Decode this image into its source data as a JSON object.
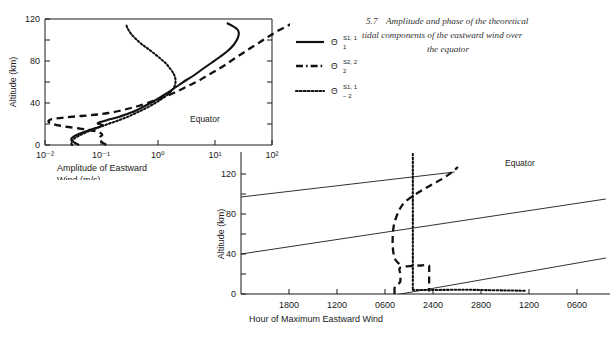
{
  "figure": {
    "caption_number": "5.7",
    "caption_text": "Amplitude and phase of the theoretical tidal components of the eastward wind over the equator"
  },
  "legend": {
    "entries": [
      {
        "style": "solid",
        "symbol": "Θ",
        "superscript": "S1, 1",
        "subscript": "1"
      },
      {
        "style": "dashed",
        "symbol": "Θ",
        "superscript": "S2, 2",
        "subscript": "2"
      },
      {
        "style": "dotted",
        "symbol": "Θ",
        "superscript": "S1, 1",
        "subscript": "− 2"
      }
    ]
  },
  "chart_data": [
    {
      "type": "line",
      "id": "amplitude",
      "title": "",
      "xlabel": "Amplitude of Eastward Wind (m/s)",
      "xlabel_line1": "Amplitude of Eastward",
      "xlabel_line2": "Wind (m/s)",
      "ylabel": "Altitude (km)",
      "annotation": "Equator",
      "xscale": "log",
      "xlim": [
        0.01,
        1000
      ],
      "ylim": [
        0,
        132
      ],
      "xticks": [
        0.01,
        0.1,
        1,
        10,
        100
      ],
      "xticklabels": [
        "10⁻²",
        "10⁻¹",
        "10⁰",
        "10¹",
        "10²"
      ],
      "yticks": [
        0,
        20,
        40,
        60,
        80,
        100,
        120
      ],
      "yticklabels": [
        "0",
        "",
        "40",
        "",
        "80",
        "",
        "120"
      ],
      "grid": false,
      "series": [
        {
          "name": "Θ S1,1 sub 1",
          "style": "solid",
          "points": [
            [
              0.04,
              0
            ],
            [
              0.034,
              2
            ],
            [
              0.03,
              4
            ],
            [
              0.029,
              6
            ],
            [
              0.031,
              8
            ],
            [
              0.036,
              10
            ],
            [
              0.044,
              12
            ],
            [
              0.055,
              14
            ],
            [
              0.07,
              16
            ],
            [
              0.09,
              18
            ],
            [
              0.105,
              19.5
            ],
            [
              0.097,
              20.5
            ],
            [
              0.085,
              21.5
            ],
            [
              0.09,
              22.5
            ],
            [
              0.11,
              24
            ],
            [
              0.145,
              26
            ],
            [
              0.2,
              28
            ],
            [
              0.28,
              31
            ],
            [
              0.42,
              35
            ],
            [
              0.62,
              40
            ],
            [
              0.9,
              45
            ],
            [
              1.25,
              50
            ],
            [
              1.7,
              55
            ],
            [
              2.3,
              60
            ],
            [
              3.1,
              65
            ],
            [
              4.3,
              70
            ],
            [
              6.0,
              76
            ],
            [
              8.5,
              82
            ],
            [
              12.0,
              88
            ],
            [
              16.5,
              94
            ],
            [
              21.0,
              100
            ],
            [
              24.5,
              106
            ],
            [
              26.0,
              111
            ],
            [
              25.0,
              115
            ],
            [
              21.5,
              118
            ],
            [
              18.0,
              120.5
            ],
            [
              16.0,
              122
            ]
          ]
        },
        {
          "name": "Θ S2,2 sub 2",
          "style": "dashed",
          "points": [
            [
              0.12,
              0
            ],
            [
              0.105,
              2
            ],
            [
              0.095,
              4
            ],
            [
              0.09,
              6
            ],
            [
              0.092,
              8
            ],
            [
              0.102,
              10
            ],
            [
              0.095,
              12
            ],
            [
              0.082,
              13.5
            ],
            [
              0.06,
              15
            ],
            [
              0.04,
              16.5
            ],
            [
              0.026,
              18
            ],
            [
              0.018,
              19.5
            ],
            [
              0.014,
              21
            ],
            [
              0.012,
              22.5
            ],
            [
              0.0115,
              24
            ],
            [
              0.0125,
              25.5
            ],
            [
              0.0155,
              26.5
            ],
            [
              0.022,
              27.5
            ],
            [
              0.034,
              28.5
            ],
            [
              0.055,
              29.5
            ],
            [
              0.085,
              30.5
            ],
            [
              0.13,
              32
            ],
            [
              0.2,
              34
            ],
            [
              0.3,
              36.5
            ],
            [
              0.44,
              39
            ],
            [
              0.64,
              42
            ],
            [
              0.9,
              45
            ],
            [
              1.3,
              48.5
            ],
            [
              1.85,
              52
            ],
            [
              2.6,
              56
            ],
            [
              3.6,
              60
            ],
            [
              5.0,
              64
            ],
            [
              7.0,
              69
            ],
            [
              10.0,
              74
            ],
            [
              14.0,
              79
            ],
            [
              20.0,
              85
            ],
            [
              29.0,
              91
            ],
            [
              42.0,
              97
            ],
            [
              62.0,
              103
            ],
            [
              90.0,
              109
            ],
            [
              135.0,
              115
            ],
            [
              200.0,
              120
            ],
            [
              280.0,
              124
            ]
          ]
        },
        {
          "name": "Θ S1,1 sub -2",
          "style": "dotted",
          "points": [
            [
              0.03,
              0
            ],
            [
              0.029,
              2
            ],
            [
              0.03,
              4
            ],
            [
              0.032,
              6
            ],
            [
              0.036,
              8
            ],
            [
              0.042,
              10
            ],
            [
              0.05,
              12
            ],
            [
              0.06,
              14
            ],
            [
              0.074,
              16
            ],
            [
              0.092,
              18
            ],
            [
              0.115,
              20
            ],
            [
              0.145,
              22
            ],
            [
              0.185,
              24
            ],
            [
              0.24,
              26.5
            ],
            [
              0.31,
              29
            ],
            [
              0.4,
              32
            ],
            [
              0.52,
              35
            ],
            [
              0.68,
              38.5
            ],
            [
              0.88,
              42
            ],
            [
              1.1,
              45.5
            ],
            [
              1.35,
              49
            ],
            [
              1.6,
              52.5
            ],
            [
              1.8,
              56
            ],
            [
              1.95,
              60
            ],
            [
              2.0,
              64
            ],
            [
              1.95,
              68
            ],
            [
              1.82,
              72
            ],
            [
              1.62,
              76
            ],
            [
              1.38,
              81
            ],
            [
              1.1,
              86
            ],
            [
              0.86,
              91
            ],
            [
              0.66,
              96
            ],
            [
              0.5,
              101
            ],
            [
              0.4,
              106
            ],
            [
              0.33,
              111
            ],
            [
              0.29,
              116
            ],
            [
              0.27,
              120
            ]
          ]
        }
      ]
    },
    {
      "type": "line",
      "id": "phase",
      "title": "",
      "xlabel": "Hour of Maximum Eastward Wind",
      "ylabel": "Altitude (km)",
      "annotation": "Equator",
      "xscale": "linear",
      "xlim": [
        0,
        7.6
      ],
      "ylim": [
        0,
        140
      ],
      "xticks": [
        1,
        2,
        3,
        4,
        5,
        6,
        7
      ],
      "xticklabels": [
        "1800",
        "1200",
        "0600",
        "2400",
        "2800",
        "1200",
        "0600"
      ],
      "yticks": [
        0,
        20,
        40,
        60,
        80,
        100,
        120
      ],
      "yticklabels": [
        "0",
        "",
        "40",
        "",
        "80",
        "",
        "120"
      ],
      "grid": false,
      "reference_lines": [
        {
          "name": "phase-line-lower",
          "x0": 0,
          "y0": -28,
          "x1": 7.6,
          "y1": 36
        },
        {
          "name": "phase-line-middle",
          "x0": 0,
          "y0": 40,
          "x1": 7.6,
          "y1": 95
        },
        {
          "name": "phase-line-upper",
          "x0": 0,
          "y0": 97,
          "x1": 4.45,
          "y1": 122
        }
      ],
      "series": [
        {
          "name": "Θ S2,2 sub 2",
          "style": "dashed",
          "points": [
            [
              3.2,
              0
            ],
            [
              3.2,
              6
            ],
            [
              3.25,
              9
            ],
            [
              3.3,
              11
            ],
            [
              3.32,
              13
            ],
            [
              3.32,
              18
            ],
            [
              3.31,
              22
            ],
            [
              3.3,
              25
            ],
            [
              3.35,
              27
            ],
            [
              3.55,
              28
            ],
            [
              3.75,
              28.5
            ],
            [
              3.9,
              29
            ],
            [
              3.92,
              27
            ],
            [
              3.92,
              22
            ],
            [
              3.92,
              16
            ],
            [
              3.92,
              10
            ],
            [
              3.92,
              4.5
            ],
            [
              3.92,
              2.5
            ]
          ],
          "points_upper": [
            [
              3.3,
              30
            ],
            [
              3.22,
              34
            ],
            [
              3.18,
              40
            ],
            [
              3.16,
              48
            ],
            [
              3.16,
              56
            ],
            [
              3.17,
              64
            ],
            [
              3.2,
              72
            ],
            [
              3.26,
              80
            ],
            [
              3.32,
              86
            ],
            [
              3.42,
              92
            ],
            [
              3.58,
              98
            ],
            [
              3.78,
              104
            ],
            [
              4.0,
              110
            ],
            [
              4.22,
              116
            ],
            [
              4.4,
              122
            ],
            [
              4.52,
              127
            ]
          ]
        },
        {
          "name": "Θ S1,1 sub -2",
          "style": "dotted",
          "points": [
            [
              3.58,
              140
            ],
            [
              3.58,
              120
            ],
            [
              3.58,
              100
            ],
            [
              3.58,
              80
            ],
            [
              3.58,
              60
            ],
            [
              3.58,
              40
            ],
            [
              3.58,
              20
            ],
            [
              3.58,
              8
            ],
            [
              3.58,
              4
            ]
          ],
          "points_horizontal": [
            [
              3.58,
              4
            ],
            [
              4.0,
              4
            ],
            [
              4.4,
              4.2
            ],
            [
              4.8,
              4.2
            ],
            [
              5.2,
              3.8
            ],
            [
              5.6,
              3.5
            ],
            [
              5.95,
              3.2
            ]
          ]
        }
      ]
    }
  ]
}
